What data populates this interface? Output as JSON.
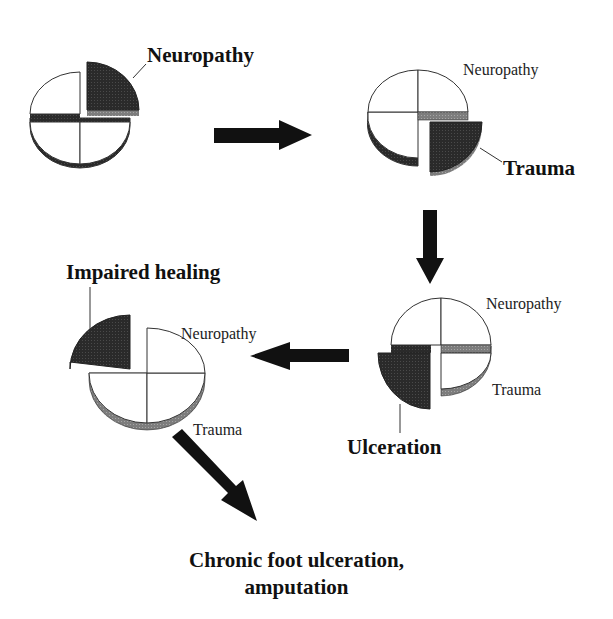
{
  "diagram": {
    "colors": {
      "dark_segment": "#2a2a2a",
      "edge_gray": "#8a8a8a",
      "outline": "#333333",
      "arrow": "#111111",
      "background": "#ffffff"
    },
    "stages": [
      {
        "id": "stage-1",
        "highlight_label": "Neuropathy",
        "highlighted_segment": "top-right",
        "other_labels": []
      },
      {
        "id": "stage-2",
        "highlight_label": "Trauma",
        "highlighted_segment": "bottom-right",
        "other_labels": [
          "Neuropathy"
        ]
      },
      {
        "id": "stage-3",
        "highlight_label": "Ulceration",
        "highlighted_segment": "bottom-left",
        "other_labels": [
          "Neuropathy",
          "Trauma"
        ]
      },
      {
        "id": "stage-4",
        "highlight_label": "Impaired healing",
        "highlighted_segment": "top-left",
        "other_labels": [
          "Neuropathy",
          "Trauma"
        ]
      }
    ],
    "arrows": [
      {
        "from": "stage-1",
        "to": "stage-2",
        "direction": "right"
      },
      {
        "from": "stage-2",
        "to": "stage-3",
        "direction": "down"
      },
      {
        "from": "stage-3",
        "to": "stage-4",
        "direction": "left"
      },
      {
        "from": "stage-4",
        "to": "outcome",
        "direction": "down-right"
      }
    ],
    "outcome": {
      "line1": "Chronic foot ulceration,",
      "line2": "amputation"
    }
  }
}
